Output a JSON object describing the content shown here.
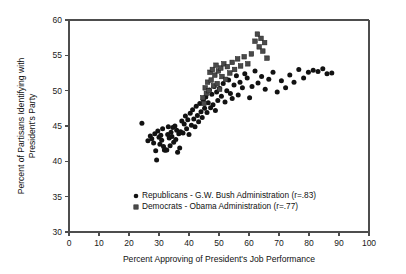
{
  "chart_data": {
    "type": "scatter",
    "title": "",
    "xlabel": "Percent Approving of President's Job Performance",
    "ylabel": "Percent of Partisans Identifying with President's Party",
    "ylabel_line1": "Percent of Partisans Identifying with",
    "ylabel_line2": "President's Party",
    "xlim": [
      0,
      100
    ],
    "ylim": [
      30,
      60
    ],
    "xticks": [
      0,
      10,
      20,
      30,
      40,
      50,
      60,
      70,
      80,
      90,
      100
    ],
    "yticks": [
      30,
      35,
      40,
      45,
      50,
      55,
      60
    ],
    "grid": false,
    "legend_position": "lower-center-inside",
    "marker_colors": {
      "republicans": "#121212",
      "democrats": "#4a4a4a",
      "axis": "#4d4d4d",
      "text": "#111111"
    },
    "series": [
      {
        "name": "Republicans - G.W. Bush Administration (r=.83)",
        "short_name": "Republicans - G.W. Bush Administration",
        "correlation": ".83",
        "marker": "circle",
        "color": "#121212",
        "points": [
          [
            24.3,
            45.4
          ],
          [
            26.3,
            42.9
          ],
          [
            27.1,
            43.6
          ],
          [
            27.6,
            43.2
          ],
          [
            28.2,
            42.6
          ],
          [
            28.6,
            43.9
          ],
          [
            28.9,
            41.5
          ],
          [
            29.2,
            40.2
          ],
          [
            29.6,
            44.3
          ],
          [
            30.0,
            43.4
          ],
          [
            30.3,
            42.4
          ],
          [
            30.6,
            43.7
          ],
          [
            30.9,
            43.0
          ],
          [
            31.2,
            44.6
          ],
          [
            31.5,
            42.1
          ],
          [
            31.8,
            41.6
          ],
          [
            32.0,
            41.6
          ],
          [
            32.3,
            41.6
          ],
          [
            32.6,
            41.6
          ],
          [
            32.9,
            43.8
          ],
          [
            33.1,
            44.9
          ],
          [
            33.4,
            43.3
          ],
          [
            33.7,
            42.2
          ],
          [
            34.0,
            44.1
          ],
          [
            34.3,
            43.5
          ],
          [
            34.6,
            44.8
          ],
          [
            34.9,
            42.7
          ],
          [
            35.3,
            45.0
          ],
          [
            35.6,
            43.1
          ],
          [
            35.9,
            44.4
          ],
          [
            36.2,
            41.3
          ],
          [
            36.6,
            43.9
          ],
          [
            36.9,
            41.9
          ],
          [
            37.2,
            44.2
          ],
          [
            37.6,
            45.7
          ],
          [
            38.0,
            44.0
          ],
          [
            38.4,
            45.3
          ],
          [
            38.8,
            46.4
          ],
          [
            39.2,
            44.6
          ],
          [
            39.6,
            45.9
          ],
          [
            40.0,
            43.8
          ],
          [
            40.4,
            46.8
          ],
          [
            40.8,
            45.1
          ],
          [
            41.2,
            47.3
          ],
          [
            41.6,
            46.0
          ],
          [
            42.0,
            44.9
          ],
          [
            42.4,
            47.8
          ],
          [
            42.8,
            46.5
          ],
          [
            43.2,
            45.6
          ],
          [
            43.6,
            48.2
          ],
          [
            44.0,
            47.0
          ],
          [
            44.4,
            46.2
          ],
          [
            44.8,
            48.7
          ],
          [
            45.2,
            47.5
          ],
          [
            45.6,
            49.1
          ],
          [
            46.0,
            46.9
          ],
          [
            46.4,
            48.3
          ],
          [
            46.8,
            50.1
          ],
          [
            47.2,
            47.6
          ],
          [
            47.6,
            49.5
          ],
          [
            48.0,
            48.0
          ],
          [
            48.4,
            50.6
          ],
          [
            48.8,
            47.2
          ],
          [
            49.2,
            49.8
          ],
          [
            49.6,
            48.6
          ],
          [
            50.2,
            50.3
          ],
          [
            50.8,
            49.2
          ],
          [
            51.4,
            51.0
          ],
          [
            52.0,
            48.4
          ],
          [
            52.6,
            50.0
          ],
          [
            53.2,
            51.5
          ],
          [
            53.8,
            49.6
          ],
          [
            54.4,
            48.9
          ],
          [
            55.0,
            50.8
          ],
          [
            55.8,
            52.1
          ],
          [
            56.4,
            49.4
          ],
          [
            57.0,
            51.2
          ],
          [
            57.8,
            50.4
          ],
          [
            58.6,
            52.4
          ],
          [
            59.4,
            51.8
          ],
          [
            60.2,
            49.0
          ],
          [
            61.0,
            50.6
          ],
          [
            62.0,
            52.8
          ],
          [
            63.0,
            51.1
          ],
          [
            64.2,
            52.0
          ],
          [
            65.4,
            50.2
          ],
          [
            66.6,
            51.6
          ],
          [
            68.0,
            52.6
          ],
          [
            69.4,
            49.8
          ],
          [
            70.8,
            51.4
          ],
          [
            72.2,
            50.4
          ],
          [
            73.6,
            52.2
          ],
          [
            75.0,
            51.2
          ],
          [
            76.6,
            53.0
          ],
          [
            78.2,
            51.8
          ],
          [
            79.8,
            52.6
          ],
          [
            81.4,
            52.9
          ],
          [
            83.0,
            52.7
          ],
          [
            84.6,
            53.1
          ],
          [
            86.0,
            52.4
          ],
          [
            87.6,
            52.5
          ]
        ]
      },
      {
        "name": "Democrats - Obama Administration (r=.77)",
        "short_name": "Democrats - Obama Administration",
        "correlation": ".77",
        "marker": "square",
        "color": "#4a4a4a",
        "points": [
          [
            44.6,
            49.0
          ],
          [
            45.0,
            48.2
          ],
          [
            45.4,
            50.4
          ],
          [
            45.8,
            49.6
          ],
          [
            46.2,
            51.2
          ],
          [
            46.6,
            50.0
          ],
          [
            47.0,
            52.6
          ],
          [
            47.4,
            51.5
          ],
          [
            47.8,
            53.0
          ],
          [
            48.2,
            50.7
          ],
          [
            48.6,
            52.2
          ],
          [
            49.0,
            53.6
          ],
          [
            49.4,
            51.0
          ],
          [
            49.8,
            52.8
          ],
          [
            50.2,
            50.2
          ],
          [
            50.6,
            53.2
          ],
          [
            51.0,
            52.0
          ],
          [
            51.6,
            53.8
          ],
          [
            52.2,
            51.6
          ],
          [
            52.8,
            53.4
          ],
          [
            53.6,
            52.5
          ],
          [
            54.4,
            54.0
          ],
          [
            55.2,
            53.0
          ],
          [
            56.2,
            54.5
          ],
          [
            57.2,
            53.5
          ],
          [
            58.4,
            54.8
          ],
          [
            59.6,
            53.8
          ],
          [
            60.8,
            55.2
          ],
          [
            62.0,
            57.0
          ],
          [
            62.8,
            58.0
          ],
          [
            63.4,
            56.2
          ],
          [
            64.0,
            57.4
          ],
          [
            64.6,
            55.6
          ],
          [
            65.2,
            56.8
          ],
          [
            66.0,
            54.6
          ]
        ]
      }
    ]
  },
  "legend": {
    "entries": [
      {
        "marker": "circle",
        "label": "Republicans - G.W. Bush Administration (r=.83)"
      },
      {
        "marker": "square",
        "label": "Democrats - Obama Administration (r=.77)"
      }
    ]
  }
}
